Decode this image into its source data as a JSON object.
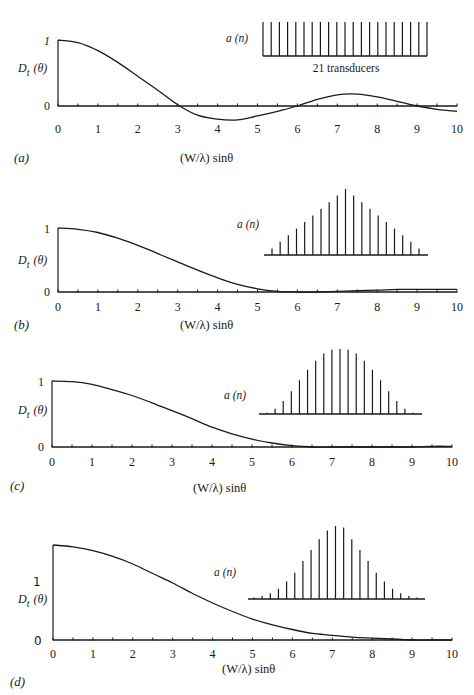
{
  "figure": {
    "x_axis_label": "(W/λ) sinθ",
    "y_axis_label_main": "D",
    "y_axis_label_sub": "t",
    "y_axis_label_arg": "(θ)",
    "inset_label": "a  (n)",
    "x_ticks": [
      "0",
      "1",
      "2",
      "3",
      "4",
      "5",
      "6",
      "7",
      "8",
      "9",
      "10"
    ],
    "y_ticks": [
      "0",
      "1"
    ]
  },
  "chart_data": [
    {
      "panel": "(a)",
      "type": "line",
      "title": "",
      "xlabel": "(W/λ) sinθ",
      "ylabel": "D_t (θ)",
      "xlim": [
        0,
        10
      ],
      "ylim": [
        -0.25,
        1
      ],
      "grid": false,
      "series": [
        {
          "name": "D_t(θ), uniform weighting",
          "x": [
            0,
            0.5,
            1,
            1.5,
            2,
            2.5,
            3,
            3.5,
            4,
            4.5,
            5,
            5.5,
            6,
            6.5,
            7,
            7.5,
            8,
            8.5,
            9,
            9.5,
            10
          ],
          "y": [
            1.0,
            0.96,
            0.84,
            0.66,
            0.45,
            0.24,
            0.02,
            -0.14,
            -0.2,
            -0.21,
            -0.15,
            -0.08,
            0.0,
            0.1,
            0.17,
            0.18,
            0.14,
            0.07,
            0.0,
            -0.05,
            -0.08
          ]
        }
      ],
      "inset": {
        "label": "a (n)",
        "annotation": "21 transducers",
        "weights": [
          1,
          1,
          1,
          1,
          1,
          1,
          1,
          1,
          1,
          1,
          1,
          1,
          1,
          1,
          1,
          1,
          1,
          1,
          1,
          1,
          1
        ]
      },
      "annotations": [
        "21 transducers"
      ]
    },
    {
      "panel": "(b)",
      "type": "line",
      "title": "",
      "xlabel": "(W/λ) sinθ",
      "ylabel": "D_t (θ)",
      "xlim": [
        0,
        10
      ],
      "ylim": [
        0,
        1
      ],
      "grid": false,
      "series": [
        {
          "name": "D_t(θ), triangular weighting",
          "x": [
            0,
            0.5,
            1,
            1.5,
            2,
            2.5,
            3,
            3.5,
            4,
            4.5,
            5,
            5.5,
            6,
            6.5,
            7,
            7.5,
            8,
            8.5,
            9,
            9.5,
            10
          ],
          "y": [
            1.0,
            0.98,
            0.93,
            0.84,
            0.73,
            0.6,
            0.47,
            0.34,
            0.22,
            0.12,
            0.05,
            0.01,
            0.0,
            0.0,
            0.01,
            0.02,
            0.03,
            0.04,
            0.04,
            0.04,
            0.04
          ]
        }
      ],
      "inset": {
        "label": "a (n)",
        "weights": [
          0.1,
          0.2,
          0.3,
          0.4,
          0.5,
          0.6,
          0.7,
          0.8,
          0.9,
          1.0,
          0.9,
          0.8,
          0.7,
          0.6,
          0.5,
          0.4,
          0.3,
          0.2,
          0.1
        ]
      }
    },
    {
      "panel": "(c)",
      "type": "line",
      "title": "",
      "xlabel": "(W/λ) sinθ",
      "ylabel": "D_t (θ)",
      "xlim": [
        0,
        10
      ],
      "ylim": [
        0,
        1
      ],
      "grid": false,
      "series": [
        {
          "name": "D_t(θ), cosine-type weighting",
          "x": [
            0,
            0.5,
            1,
            1.5,
            2,
            2.5,
            3,
            3.5,
            4,
            4.5,
            5,
            5.5,
            6,
            6.5,
            7,
            7.5,
            8,
            8.5,
            9,
            9.5,
            10
          ],
          "y": [
            1.0,
            0.99,
            0.95,
            0.87,
            0.78,
            0.67,
            0.55,
            0.43,
            0.3,
            0.2,
            0.12,
            0.06,
            0.02,
            0.0,
            0.0,
            0.0,
            0.0,
            0.0,
            0.0,
            0.01,
            0.01
          ]
        }
      ],
      "inset": {
        "label": "a (n)",
        "weights": [
          0.02,
          0.08,
          0.2,
          0.35,
          0.52,
          0.68,
          0.82,
          0.93,
          0.99,
          1.0,
          0.99,
          0.93,
          0.82,
          0.68,
          0.52,
          0.35,
          0.2,
          0.08,
          0.02
        ]
      }
    },
    {
      "panel": "(d)",
      "type": "line",
      "title": "",
      "xlabel": "(W/λ) sinθ",
      "ylabel": "D_t (θ)",
      "xlim": [
        0,
        10
      ],
      "ylim": [
        0,
        1
      ],
      "grid": false,
      "series": [
        {
          "name": "D_t(θ), Gaussian-type weighting",
          "x": [
            0,
            0.5,
            1,
            1.5,
            2,
            2.5,
            3,
            3.5,
            4,
            4.5,
            5,
            5.5,
            6,
            6.5,
            7,
            7.5,
            8,
            8.5,
            9,
            9.5,
            10
          ],
          "y": [
            1.0,
            0.98,
            0.94,
            0.88,
            0.8,
            0.7,
            0.6,
            0.49,
            0.39,
            0.3,
            0.22,
            0.16,
            0.11,
            0.07,
            0.05,
            0.03,
            0.02,
            0.01,
            0.0,
            0.0,
            0.0
          ]
        }
      ],
      "inset": {
        "label": "a (n)",
        "weights": [
          0.02,
          0.04,
          0.08,
          0.14,
          0.24,
          0.36,
          0.52,
          0.67,
          0.82,
          0.94,
          1.0,
          0.98,
          0.82,
          0.67,
          0.52,
          0.36,
          0.24,
          0.14,
          0.08,
          0.04,
          0.02
        ]
      }
    }
  ],
  "panels": [
    {
      "label": "(a)"
    },
    {
      "label": "(b)"
    },
    {
      "label": "(c)"
    },
    {
      "label": "(d)"
    }
  ]
}
